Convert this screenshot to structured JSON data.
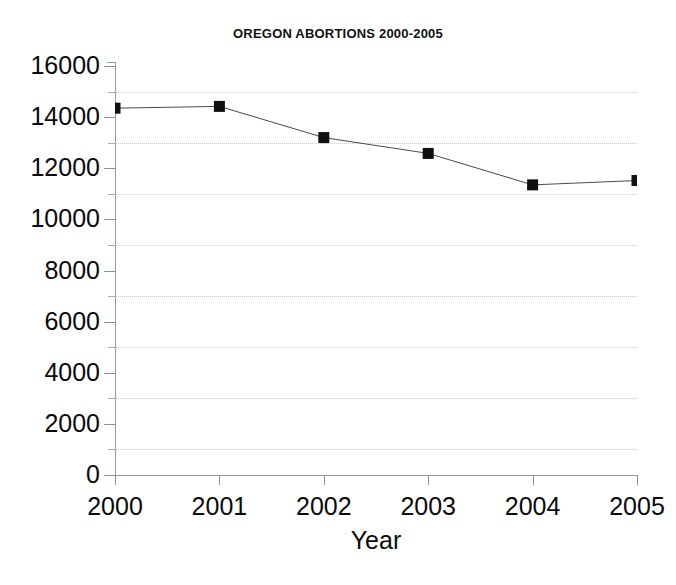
{
  "chart_data": {
    "type": "line",
    "title": "OREGON ABORTIONS 2000-2005",
    "xlabel": "Year",
    "ylabel": "",
    "categories": [
      "2000",
      "2001",
      "2002",
      "2003",
      "2004",
      "2005"
    ],
    "x": [
      2000,
      2001,
      2002,
      2003,
      2004,
      2005
    ],
    "values": [
      14350,
      14420,
      13200,
      12580,
      11350,
      11520
    ],
    "series": [
      {
        "name": "Abortions",
        "values": [
          14350,
          14420,
          13200,
          12580,
          11350,
          11520
        ]
      }
    ],
    "ylim": [
      0,
      16000
    ],
    "xlim": [
      2000,
      2005
    ],
    "y_ticks": [
      0,
      2000,
      4000,
      6000,
      8000,
      10000,
      12000,
      14000,
      16000
    ],
    "y_tick_labels": [
      "0",
      "2000",
      "4000",
      "6000",
      "8000",
      "10000",
      "12000",
      "14000",
      "16000"
    ],
    "y_minor_ticks": [
      1000,
      3000,
      5000,
      7000,
      9000,
      11000,
      13000,
      15000
    ],
    "x_ticks": [
      2000,
      2001,
      2002,
      2003,
      2004,
      2005
    ],
    "x_tick_labels": [
      "2000",
      "2001",
      "2002",
      "2003",
      "2004",
      "2005"
    ],
    "gridlines": {
      "horizontal_at": [
        1000,
        3000,
        5000,
        7000,
        9000,
        11000,
        13000,
        15000
      ],
      "style": "dotted",
      "color": "#c9c9c9",
      "vertical": false
    },
    "legend": {
      "visible": false,
      "position": "none"
    },
    "marker": {
      "shape": "square",
      "color": "#111111",
      "size": 11
    },
    "line": {
      "color": "#4a4a4a",
      "width": 1
    },
    "axis_color": "#8f8f8f",
    "background": "#ffffff"
  }
}
